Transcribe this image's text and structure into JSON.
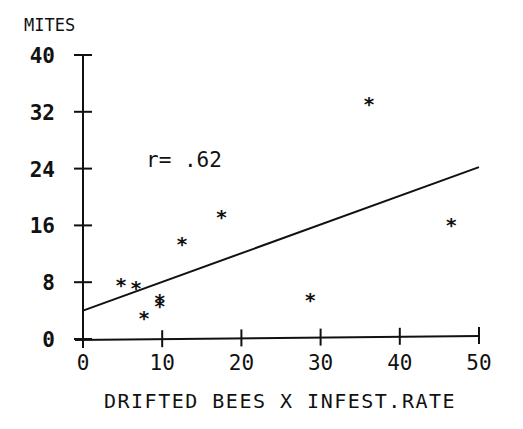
{
  "chart_data": {
    "type": "scatter",
    "title": "",
    "xlabel": "DRIFTED BEES X INFEST.RATE",
    "ylabel": "MITES",
    "xlim": [
      0,
      50
    ],
    "ylim": [
      0,
      40
    ],
    "xticks": [
      0,
      10,
      20,
      30,
      40,
      50
    ],
    "yticks": [
      0,
      8,
      16,
      24,
      32,
      40
    ],
    "grid": false,
    "legend": null,
    "annotation": "r= .62",
    "marker": "asterisk",
    "points": [
      {
        "x": 4.8,
        "y": 7.7
      },
      {
        "x": 6.7,
        "y": 7.3
      },
      {
        "x": 7.7,
        "y": 3.1
      },
      {
        "x": 9.7,
        "y": 5.5
      },
      {
        "x": 9.7,
        "y": 4.8
      },
      {
        "x": 12.5,
        "y": 13.5
      },
      {
        "x": 17.5,
        "y": 17.3
      },
      {
        "x": 28.7,
        "y": 5.6
      },
      {
        "x": 36.1,
        "y": 33.2
      },
      {
        "x": 46.5,
        "y": 16.2
      }
    ],
    "regression_line": {
      "x": [
        0,
        50
      ],
      "y": [
        4.0,
        24.2
      ]
    }
  }
}
